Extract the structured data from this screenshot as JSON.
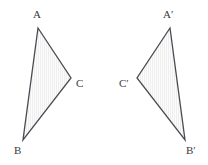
{
  "figure": {
    "kind": "geometry-diagram",
    "background_color": "#ffffff",
    "width": 208,
    "height": 165,
    "stroke_color": "#4a4a52",
    "stroke_width": 1.3,
    "fill_color": "#fbfbfb",
    "hatch_color": "#efeff0",
    "label_color": "#3a3a3c",
    "label_font_size": 11
  },
  "shapes": [
    {
      "name": "triangle-abc",
      "label": "Triangle ABC",
      "points": "38,28 71,78 23,140",
      "vertices": [
        {
          "id": "A",
          "label": "A",
          "x": 38,
          "y": 28,
          "label_x": 33,
          "label_y": 9
        },
        {
          "id": "C",
          "label": "C",
          "x": 71,
          "y": 78,
          "label_x": 76,
          "label_y": 78
        },
        {
          "id": "B",
          "label": "B",
          "x": 23,
          "y": 140,
          "label_x": 14,
          "label_y": 145
        }
      ]
    },
    {
      "name": "triangle-a-prime-b-prime-c-prime",
      "label": "Triangle A'B'C'",
      "points": "170,28 137,78 185,140",
      "vertices": [
        {
          "id": "Aprime",
          "label": "A′",
          "x": 170,
          "y": 28,
          "label_x": 163,
          "label_y": 9
        },
        {
          "id": "Cprime",
          "label": "C′",
          "x": 137,
          "y": 78,
          "label_x": 119,
          "label_y": 78
        },
        {
          "id": "Bprime",
          "label": "B′",
          "x": 185,
          "y": 140,
          "label_x": 186,
          "label_y": 145
        }
      ]
    }
  ]
}
